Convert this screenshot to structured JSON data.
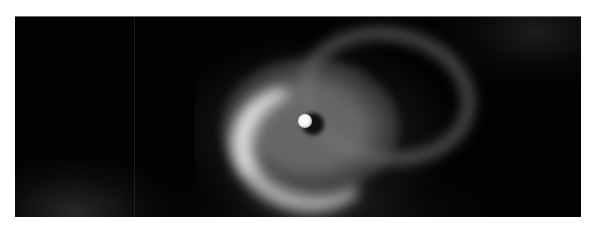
{
  "image": {
    "subject": "Bright star with surrounding circumstellar disk and nebular loop",
    "alt": "Grayscale astronomical image of a bright central star surrounded by a glowing crescent-shaped disk with a faint loop structure extending to the upper right",
    "palette": {
      "background": "#020202",
      "disk": "#7a7a7a",
      "crescent": "#e6e6e6",
      "star": "#ffffff",
      "page": "#ffffff"
    }
  }
}
